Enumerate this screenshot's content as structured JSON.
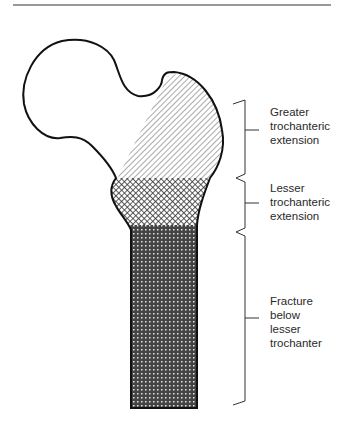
{
  "figure": {
    "type": "anatomical-diagram"
  },
  "labels": {
    "greater": "Greater\ntrochanteric\nextension",
    "lesser": "Lesser\ntrochanteric\nextension",
    "below": "Fracture\nbelow\nlesser\ntrochanter"
  },
  "colors": {
    "ink": "#111111",
    "text": "#2a2a2a",
    "background": "#ffffff"
  }
}
